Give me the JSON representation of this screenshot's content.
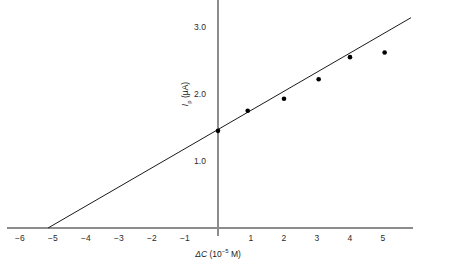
{
  "chart_data": {
    "type": "scatter",
    "title": "",
    "xlabel": "ΔC (10⁻⁵ M)",
    "xlabel_parts": {
      "symbol": "ΔC",
      "unit_open": " (10",
      "exponent": "−5",
      "unit_close": " M)"
    },
    "ylabel": "Iₚ (µA)",
    "ylabel_parts": {
      "symbol": "I",
      "subscript": "p",
      "unit": " (µA)"
    },
    "xlim": [
      -6.4,
      5.9
    ],
    "ylim": [
      0,
      3.35
    ],
    "xticks": [
      -6,
      -5,
      -4,
      -3,
      -2,
      -1,
      1,
      2,
      3,
      4,
      5
    ],
    "xtick_labels": [
      "−6",
      "−5",
      "−4",
      "−3",
      "−2",
      "−1",
      "1",
      "2",
      "3",
      "4",
      "5"
    ],
    "yticks": [
      1.0,
      2.0,
      3.0
    ],
    "ytick_labels": [
      "1.0",
      "2.0",
      "3.0"
    ],
    "grid": false,
    "legend": null,
    "x": [
      0.0,
      0.9,
      2.0,
      3.05,
      4.0,
      5.05
    ],
    "y": [
      1.45,
      1.75,
      1.93,
      2.22,
      2.55,
      2.62
    ],
    "points": [
      {
        "x": 0.0,
        "y": 1.45
      },
      {
        "x": 0.9,
        "y": 1.75
      },
      {
        "x": 2.0,
        "y": 1.93
      },
      {
        "x": 3.05,
        "y": 2.22
      },
      {
        "x": 4.0,
        "y": 2.55
      },
      {
        "x": 5.05,
        "y": 2.62
      }
    ],
    "marker": {
      "shape": "circle",
      "color": "#000000",
      "size_px": 4.6
    },
    "fit_line": {
      "type": "linear",
      "slope": 0.2854,
      "intercept": 1.47,
      "x_intercept": -5.15,
      "x_start": -5.15,
      "x_end": 5.85,
      "color": "#1a1a1a",
      "width_px": 1.0
    },
    "axis_color": "#8c8c8c",
    "text_color": "#1a1a1a",
    "background": "#ffffff"
  },
  "geometry": {
    "x0_px": 218.0,
    "y0_px": 228.0,
    "px_per_x_unit": 33.0,
    "px_per_y_unit": 67.0
  }
}
